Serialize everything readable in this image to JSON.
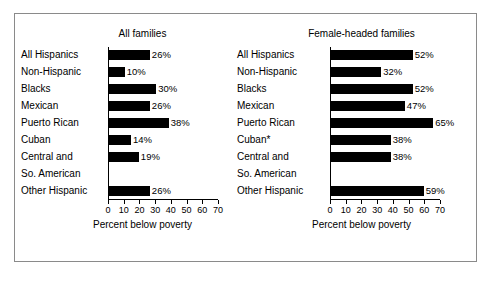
{
  "chart_data": {
    "type": "bar",
    "title": "",
    "orientation": "horizontal",
    "grid": false,
    "legend": null,
    "xlabel": "Percent below poverty",
    "ylabel": "",
    "xlim": [
      0,
      70
    ],
    "xticks": [
      0,
      10,
      20,
      30,
      40,
      50,
      60,
      70
    ],
    "categories": [
      "All Hispanics",
      "Non-Hispanic",
      "Blacks",
      "Mexican",
      "Puerto Rican",
      "Cuban",
      "Central and So. American",
      "Other Hispanic"
    ],
    "panels": [
      {
        "title": "All families",
        "axis_caption": "Percent below poverty",
        "categories": [
          "All Hispanics",
          "Non-Hispanic",
          "Blacks",
          "Mexican",
          "Puerto Rican",
          "Cuban",
          "Central and",
          "So. American",
          "Other Hispanic"
        ],
        "bars": [
          {
            "label": "All Hispanics",
            "value": 26,
            "value_label": "26%"
          },
          {
            "label": "Non-Hispanic",
            "value": 10,
            "value_label": "10%"
          },
          {
            "label": "Blacks",
            "value": 30,
            "value_label": "30%"
          },
          {
            "label": "Mexican",
            "value": 26,
            "value_label": "26%"
          },
          {
            "label": "Puerto Rican",
            "value": 38,
            "value_label": "38%"
          },
          {
            "label": "Cuban",
            "value": 14,
            "value_label": "14%"
          },
          {
            "label": "Central and So. American",
            "value": 19,
            "value_label": "19%"
          },
          {
            "label": "Other Hispanic",
            "value": 26,
            "value_label": "26%"
          }
        ]
      },
      {
        "title": "Female-headed families",
        "axis_caption": "Percent below poverty",
        "categories": [
          "All Hispanics",
          "Non-Hispanic",
          "Blacks",
          "Mexican",
          "Puerto Rican",
          "Cuban*",
          "Central and",
          "So. American",
          "Other Hispanic"
        ],
        "bars": [
          {
            "label": "All Hispanics",
            "value": 52,
            "value_label": "52%"
          },
          {
            "label": "Non-Hispanic",
            "value": 32,
            "value_label": "32%"
          },
          {
            "label": "Blacks",
            "value": 52,
            "value_label": "52%"
          },
          {
            "label": "Mexican",
            "value": 47,
            "value_label": "47%"
          },
          {
            "label": "Puerto Rican",
            "value": 65,
            "value_label": "65%"
          },
          {
            "label": "Cuban*",
            "value": 38,
            "value_label": "38%"
          },
          {
            "label": "Central and So. American",
            "value": 38,
            "value_label": "38%"
          },
          {
            "label": "Other Hispanic",
            "value": 59,
            "value_label": "59%"
          }
        ]
      }
    ],
    "colors": {
      "bar": "#000000",
      "axis": "#000000",
      "text": "#000000",
      "background": "#ffffff",
      "border": "#8a8a8a"
    }
  }
}
